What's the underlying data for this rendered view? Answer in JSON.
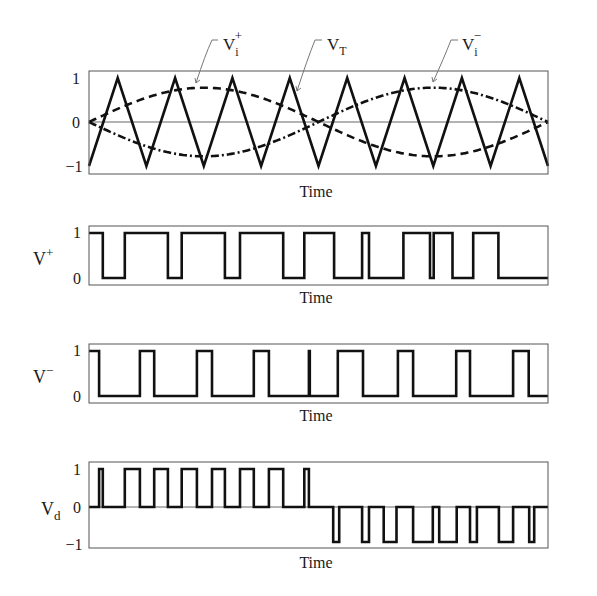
{
  "chart_data": [
    {
      "id": "carrier",
      "type": "line",
      "title": "",
      "xlabel": "Time",
      "ylabel": "",
      "ylim": [
        -1,
        1
      ],
      "yticks": [
        "1",
        "0",
        "-1"
      ],
      "grid": false,
      "zero_line": true,
      "series": [
        {
          "name": "V_T",
          "label_main": "V",
          "label_sub": "T",
          "label_sup": "",
          "style": "solid",
          "kind": "triangle",
          "periods": 8,
          "amplitude": 1,
          "start": -1
        },
        {
          "name": "V_i+",
          "label_main": "V",
          "label_sub": "i",
          "label_sup": "+",
          "style": "dashed",
          "kind": "sine",
          "cycles": 1,
          "amplitude": 0.78,
          "phase": 0
        },
        {
          "name": "V_i-",
          "label_main": "V",
          "label_sub": "i",
          "label_sup": "−",
          "style": "dash-dot",
          "kind": "sine",
          "cycles": 1,
          "amplitude": -0.78,
          "phase": 0
        }
      ]
    },
    {
      "id": "vplus",
      "type": "line",
      "xlabel": "Time",
      "ylabel_main": "V",
      "ylabel_sup": "+",
      "ylim": [
        0,
        1
      ],
      "yticks": [
        "1",
        "0"
      ],
      "start_level": 1,
      "transitions_x": [
        0.03,
        0.078,
        0.172,
        0.202,
        0.296,
        0.329,
        0.423,
        0.469,
        0.534,
        0.595,
        0.61,
        0.685,
        0.743,
        0.751,
        0.792,
        0.837,
        0.892
      ]
    },
    {
      "id": "vminus",
      "type": "line",
      "xlabel": "Time",
      "ylabel_main": "V",
      "ylabel_sup": "−",
      "ylim": [
        0,
        1
      ],
      "yticks": [
        "1",
        "0"
      ],
      "start_level": 1,
      "transitions_x": [
        0.022,
        0.111,
        0.142,
        0.235,
        0.268,
        0.359,
        0.392,
        0.479,
        0.481,
        0.542,
        0.597,
        0.673,
        0.706,
        0.8,
        0.83,
        0.924,
        0.958
      ]
    },
    {
      "id": "vd",
      "type": "line",
      "xlabel": "Time",
      "ylabel_main": "V",
      "ylabel_sub": "d",
      "ylim": [
        -1,
        1
      ],
      "yticks": [
        "1",
        "0",
        "-1"
      ],
      "zero_line": true,
      "pulses": [
        {
          "from": 0.022,
          "to": 0.03,
          "level": 1
        },
        {
          "from": 0.078,
          "to": 0.111,
          "level": 1
        },
        {
          "from": 0.142,
          "to": 0.172,
          "level": 1
        },
        {
          "from": 0.202,
          "to": 0.235,
          "level": 1
        },
        {
          "from": 0.268,
          "to": 0.296,
          "level": 1
        },
        {
          "from": 0.329,
          "to": 0.359,
          "level": 1
        },
        {
          "from": 0.392,
          "to": 0.423,
          "level": 1
        },
        {
          "from": 0.469,
          "to": 0.479,
          "level": 1
        },
        {
          "from": 0.532,
          "to": 0.545,
          "level": -1
        },
        {
          "from": 0.595,
          "to": 0.61,
          "level": -1
        },
        {
          "from": 0.642,
          "to": 0.67,
          "level": -1
        },
        {
          "from": 0.706,
          "to": 0.749,
          "level": -1
        },
        {
          "from": 0.763,
          "to": 0.801,
          "level": -1
        },
        {
          "from": 0.83,
          "to": 0.845,
          "level": -1
        },
        {
          "from": 0.893,
          "to": 0.924,
          "level": -1
        },
        {
          "from": 0.959,
          "to": 0.97,
          "level": -1
        }
      ]
    }
  ],
  "labels": {
    "time": "Time",
    "tick_1": "1",
    "tick_0": "0",
    "tick_m1": "−1",
    "v": "V",
    "sub_i": "i",
    "sub_T": "T",
    "sub_d": "d",
    "sup_plus": "+",
    "sup_minus": "−"
  }
}
